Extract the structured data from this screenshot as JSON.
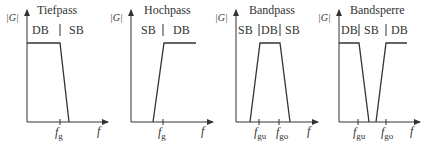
{
  "panels": [
    {
      "title": "Tiefpass",
      "y_label": "|G|",
      "x_label": "f",
      "bands": [
        "DB",
        "SB"
      ],
      "ticks": [
        {
          "base": "f",
          "sub": "g"
        }
      ]
    },
    {
      "title": "Hochpass",
      "y_label": "|G|",
      "x_label": "f",
      "bands": [
        "SB",
        "DB"
      ],
      "ticks": [
        {
          "base": "f",
          "sub": "g"
        }
      ]
    },
    {
      "title": "Bandpass",
      "y_label": "|G|",
      "x_label": "f",
      "bands": [
        "SB",
        "DB",
        "SB"
      ],
      "ticks": [
        {
          "base": "f",
          "sub": "gu"
        },
        {
          "base": "f",
          "sub": "go"
        }
      ]
    },
    {
      "title": "Bandsperre",
      "y_label": "|G|",
      "x_label": "f",
      "bands": [
        "DB",
        "SB",
        "DB"
      ],
      "ticks": [
        {
          "base": "f",
          "sub": "gu"
        },
        {
          "base": "f",
          "sub": "go"
        }
      ]
    }
  ],
  "colors": {
    "line": "#333333",
    "background": "#ffffff"
  }
}
